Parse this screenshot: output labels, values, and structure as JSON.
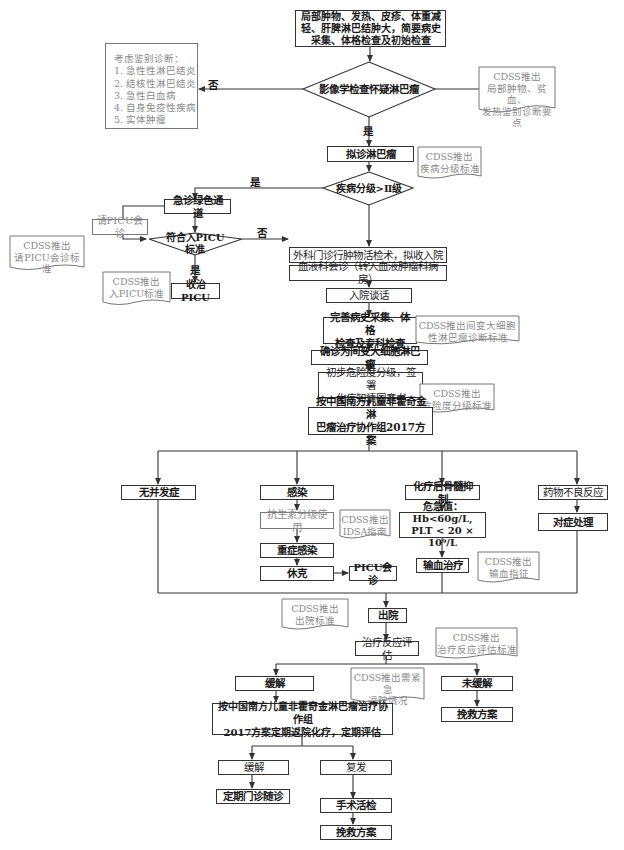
{
  "flowchart": {
    "start": "局部肿物、发热、皮疹、体重减\n轻、肝脾淋巴结肿大，简要病史\n采集、体格检查及初始检查",
    "decision_imaging": "影像学检查怀疑淋巴瘤",
    "differential": "考虑鉴别诊断：\n1. 急性性淋巴结炎\n2. 结核性淋巴结炎\n3. 急性白血病\n4. 自身免疫性疾病\n5. 实体肿瘤",
    "cdss_differential": "CDSS推出\n局部肿物、贫血、\n发热鉴别诊断要点",
    "label_no_1": "否",
    "label_yes_1": "是",
    "suspected_lymphoma": "拟诊淋巴瘤",
    "cdss_grading": "CDSS推出\n疾病分级标准",
    "decision_grade": "疾病分级>Ⅱ级",
    "label_yes_2": "是",
    "emergency_green": "急诊绿色通道",
    "request_picu": "请PICU会诊",
    "cdss_picu_consult": "CDSS推出\n请PICU会诊标准",
    "decision_picu": "符合入PICU\n标准",
    "label_no_3": "否",
    "label_yes_3": "是",
    "cdss_picu_admit": "CDSS推出\n入PICU标准",
    "admit_picu": "收治PICU",
    "surgery_biopsy": "外科门诊行肿物活检术，拟收入院",
    "hematology_consult": "血液科会诊（转入血液肿瘤科病房）",
    "admission_talk": "入院谈话",
    "complete_history": "完善病史采集、体格\n检查及专科检查",
    "cdss_alcl": "CDSS推出间变大细胞\n性淋巴瘤诊断标准",
    "confirm_alcl": "确诊为间变大细胞淋巴瘤",
    "risk_grading": "初步危险度分级，签署\n化疗知情同意书",
    "cdss_risk": "CDSS推出\n危险度分级标准",
    "protocol": "按中国南方儿童非霍奇金淋\n巴瘤治疗协作组2017方案",
    "no_complication": "无并发症",
    "infection": "感染",
    "antibiotics": "抗生素分级使用",
    "cdss_idsa": "CDSS推出\nIDSA指南",
    "severe_infection": "重症感染",
    "shock": "休克",
    "picu_consult": "PICU会诊",
    "myelosuppression": "化疗后骨髓抑制",
    "critical_values": "危急值：Hb<60g/L,\nPLT < 20 × 10⁹/L",
    "transfusion": "输血治疗",
    "cdss_transfusion": "CDSS推出\n输血指征",
    "adverse_reaction": "药物不良反应",
    "symptomatic": "对症处理",
    "cdss_discharge": "CDSS推出\n出院标准",
    "discharge": "出院",
    "response_eval": "治疗反应评估",
    "cdss_response": "CDSS推出\n治疗反应评估标准",
    "remission_1": "缓解",
    "cdss_urgent": "CDSS推出需紧急\n返院情况",
    "no_remission": "未缓解",
    "salvage_1": "挽救方案",
    "regular_chemo": "按中国南方儿童非霍奇金淋巴瘤治疗协作组\n2017方案定期返院化疗，定期评估",
    "remission_2": "缓解",
    "relapse": "复发",
    "regular_followup": "定期门诊随诊",
    "surgical_biopsy_2": "手术活检",
    "salvage_2": "挽救方案"
  },
  "colors": {
    "line": "#333333",
    "gray_text": "#8a8a8a"
  }
}
